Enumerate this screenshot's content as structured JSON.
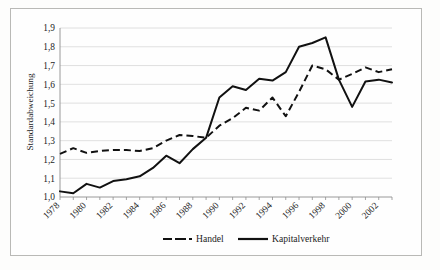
{
  "chart_data": {
    "type": "line",
    "title": "",
    "xlabel": "",
    "ylabel": "Standardabweichung",
    "ylim": [
      1.0,
      1.9
    ],
    "ytick_labels": [
      "1,0",
      "1,1",
      "1,2",
      "1,3",
      "1,4",
      "1,5",
      "1,6",
      "1,7",
      "1,8",
      "1,9"
    ],
    "ytick_values": [
      1.0,
      1.1,
      1.2,
      1.3,
      1.4,
      1.5,
      1.6,
      1.7,
      1.8,
      1.9
    ],
    "x": [
      1978,
      1979,
      1980,
      1981,
      1982,
      1983,
      1984,
      1985,
      1986,
      1987,
      1988,
      1989,
      1990,
      1991,
      1992,
      1993,
      1994,
      1995,
      1996,
      1997,
      1998,
      1999,
      2000,
      2001,
      2002,
      2003
    ],
    "xtick_labels": [
      "1978",
      "",
      "1980",
      "",
      "1982",
      "",
      "1984",
      "",
      "1986",
      "",
      "1988",
      "",
      "1990",
      "",
      "1992",
      "",
      "1994",
      "",
      "1996",
      "",
      "1998",
      "",
      "2000",
      "",
      "2002",
      ""
    ],
    "xtick_labels_shown": [
      "1978",
      "1980",
      "1982",
      "1984",
      "1986",
      "1988",
      "1990",
      "1992",
      "1994",
      "1996",
      "1998",
      "2000",
      "2002"
    ],
    "grid": true,
    "grid_axis": "y",
    "legend_position": "bottom",
    "series": [
      {
        "name": "Handel",
        "style": "dashed",
        "color": "#111111",
        "values": [
          1.23,
          1.26,
          1.235,
          1.245,
          1.25,
          1.25,
          1.245,
          1.26,
          1.3,
          1.33,
          1.325,
          1.315,
          1.38,
          1.42,
          1.475,
          1.46,
          1.53,
          1.43,
          1.56,
          1.7,
          1.68,
          1.625,
          1.655,
          1.69,
          1.665,
          1.68
        ]
      },
      {
        "name": "Kapitalverkehr",
        "style": "solid",
        "color": "#111111",
        "values": [
          1.03,
          1.02,
          1.07,
          1.05,
          1.085,
          1.095,
          1.11,
          1.155,
          1.22,
          1.18,
          1.255,
          1.315,
          1.53,
          1.59,
          1.57,
          1.63,
          1.62,
          1.665,
          1.8,
          1.82,
          1.85,
          1.625,
          1.48,
          1.615,
          1.625,
          1.61
        ]
      }
    ]
  },
  "legend": {
    "entries": [
      {
        "label": "Handel",
        "style": "dashed"
      },
      {
        "label": "Kapitalverkehr",
        "style": "solid"
      }
    ]
  }
}
